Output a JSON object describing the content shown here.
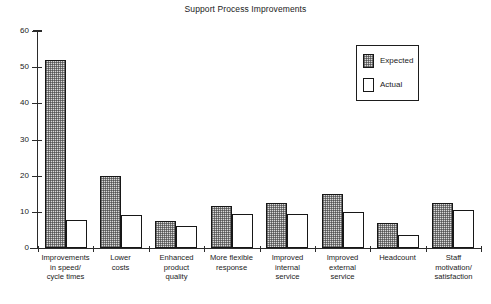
{
  "chart_data": {
    "type": "bar",
    "title": "Support Process Improvements",
    "xlabel": "",
    "ylabel": "",
    "ylim": [
      0,
      60
    ],
    "yticks": [
      0,
      10,
      20,
      30,
      40,
      50,
      60
    ],
    "grid": false,
    "legend_position": "top-right",
    "categories": [
      "Improvements\nin speed/\ncycle times",
      "Lower\ncosts",
      "Enhanced\nproduct\nquality",
      "More flexible\nresponse",
      "Improved\ninternal\nservice",
      "Improved\nexternal\nservice",
      "Headcount",
      "Staff\nmotivation/\nsatisfaction"
    ],
    "series": [
      {
        "name": "Expected",
        "fill": "stipple",
        "color": "#d9d9d9",
        "values": [
          52,
          20,
          7.5,
          11.5,
          12.5,
          15,
          7,
          12.5
        ]
      },
      {
        "name": "Actual",
        "fill": "solid",
        "color": "#ffffff",
        "values": [
          7.8,
          9,
          6,
          9.5,
          9.5,
          10,
          3.5,
          10.5
        ]
      }
    ]
  },
  "axis": {
    "tick_labels": [
      "0",
      "10",
      "20",
      "30",
      "40",
      "50",
      "60"
    ]
  },
  "legend": {
    "entries": [
      {
        "label": "Expected",
        "swatch": "stipple-swatch"
      },
      {
        "label": "Actual",
        "swatch": "white-swatch"
      }
    ]
  }
}
